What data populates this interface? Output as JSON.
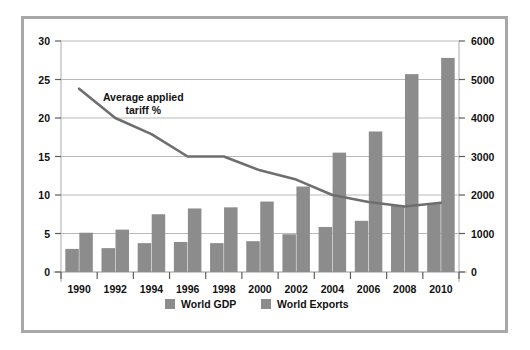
{
  "chart_data": {
    "type": "bar",
    "title": "",
    "subtitle": "",
    "xlabel": "",
    "ylabel": "",
    "y2label": "",
    "categories": [
      "1990",
      "1992",
      "1994",
      "1996",
      "1998",
      "2000",
      "2002",
      "2004",
      "2006",
      "2008",
      "2010"
    ],
    "ylim": [
      0,
      30
    ],
    "yticks": [
      0,
      5,
      10,
      15,
      20,
      25,
      30
    ],
    "ytick_labels": [
      "0",
      "5",
      "10",
      "15",
      "20",
      "25",
      "30"
    ],
    "y2lim": [
      0,
      6000
    ],
    "y2ticks": [
      0,
      1000,
      2000,
      3000,
      4000,
      5000,
      6000
    ],
    "y2tick_labels": [
      "0",
      "1000",
      "2000",
      "3000",
      "4000",
      "5000",
      "6000"
    ],
    "grid": true,
    "legend_position": "bottom",
    "series": [
      {
        "name": "World GDP",
        "type": "bar",
        "axis": "right",
        "color": "#8c8c8c",
        "values_right_axis": [
          600,
          620,
          750,
          780,
          750,
          800,
          980,
          1170,
          1330,
          1720,
          1770
        ],
        "values_left_axis": [
          3.0,
          3.1,
          3.75,
          3.9,
          3.75,
          4.0,
          4.9,
          5.85,
          6.65,
          8.6,
          8.85
        ]
      },
      {
        "name": "World Exports",
        "type": "bar",
        "axis": "right",
        "color": "#8c8c8c",
        "values_right_axis": [
          1020,
          1100,
          1500,
          1650,
          1680,
          1830,
          2220,
          3100,
          3650,
          5140,
          5560
        ],
        "values_left_axis": [
          5.1,
          5.5,
          7.5,
          8.25,
          8.4,
          9.15,
          11.1,
          15.5,
          18.25,
          25.7,
          27.8
        ]
      },
      {
        "name": "Average applied tariff %",
        "type": "line",
        "axis": "left",
        "color": "#6e6e6e",
        "values": [
          23.8,
          20.0,
          17.9,
          15.0,
          15.0,
          13.2,
          12.0,
          10.0,
          9.1,
          8.5,
          9.0
        ]
      }
    ],
    "annotations": [
      {
        "name": "tariff-line-annotation",
        "line1": "Average applied",
        "line2": "tariff %",
        "x_category": "1992",
        "y_value": 22.2
      }
    ],
    "legend": [
      {
        "label": "World GDP",
        "color": "#8c8c8c"
      },
      {
        "label": "World Exports",
        "color": "#8c8c8c"
      }
    ]
  },
  "colors": {
    "bar": "#8c8c8c",
    "line": "#6e6e6e",
    "grid": "#b9b9b9",
    "frame": "#a8a8a8",
    "text": "#111111",
    "background": "#ffffff"
  }
}
